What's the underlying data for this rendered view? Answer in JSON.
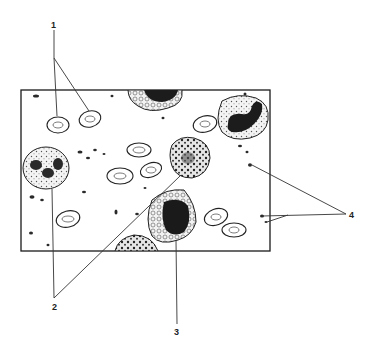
{
  "figure": {
    "type": "blood smear illustration",
    "colors": {
      "ink": "#1a1a1a",
      "background": "#ffffff",
      "cytoplasm": "#e9e9e9",
      "nucleus": "#1c1c1c"
    }
  },
  "labels": [
    {
      "id": "1",
      "text": "1",
      "meaning": "red blood cells"
    },
    {
      "id": "2",
      "text": "2",
      "meaning": "granulocytes"
    },
    {
      "id": "3",
      "text": "3",
      "meaning": "monocyte"
    },
    {
      "id": "4",
      "text": "4",
      "meaning": "platelets"
    }
  ]
}
